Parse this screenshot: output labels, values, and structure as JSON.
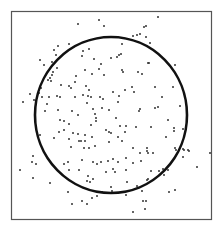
{
  "chart_data": {
    "type": "scatter",
    "title": "",
    "xlabel": "",
    "ylabel": "",
    "grid": false,
    "legend": null,
    "frame": {
      "x0": 11,
      "y0": 11,
      "x1": 211,
      "y1": 219
    },
    "circle": {
      "cx": 111,
      "cy": 115,
      "rx": 76,
      "ry": 78,
      "stroke": "#111111",
      "stroke_width": 2.6
    },
    "point_color": "#333333",
    "point_radius": 1.0,
    "points": [
      [
        78,
        24
      ],
      [
        69,
        44
      ],
      [
        58,
        46
      ],
      [
        54,
        50
      ],
      [
        56,
        55
      ],
      [
        40,
        60
      ],
      [
        52,
        62
      ],
      [
        44,
        65
      ],
      [
        57,
        68
      ],
      [
        53,
        72
      ],
      [
        52,
        75
      ],
      [
        50,
        78
      ],
      [
        48,
        80
      ],
      [
        76,
        76
      ],
      [
        82,
        56
      ],
      [
        99,
        20
      ],
      [
        104,
        26
      ],
      [
        144,
        27
      ],
      [
        140,
        34
      ],
      [
        137,
        35
      ],
      [
        133,
        36
      ],
      [
        146,
        37
      ],
      [
        122,
        44
      ],
      [
        89,
        49
      ],
      [
        83,
        51
      ],
      [
        121,
        54
      ],
      [
        119,
        55
      ],
      [
        117,
        57
      ],
      [
        94,
        59
      ],
      [
        111,
        58
      ],
      [
        101,
        64
      ],
      [
        85,
        70
      ],
      [
        99,
        69
      ],
      [
        122,
        70
      ],
      [
        123,
        72
      ],
      [
        138,
        72
      ],
      [
        142,
        74
      ],
      [
        92,
        74
      ],
      [
        104,
        75
      ],
      [
        148,
        63
      ],
      [
        158,
        17
      ],
      [
        146,
        26
      ],
      [
        150,
        43
      ],
      [
        149,
        63
      ],
      [
        175,
        65
      ],
      [
        51,
        81
      ],
      [
        69,
        86
      ],
      [
        75,
        82
      ],
      [
        71,
        88
      ],
      [
        61,
        85
      ],
      [
        41,
        88
      ],
      [
        39,
        93
      ],
      [
        30,
        94
      ],
      [
        23,
        102
      ],
      [
        34,
        100
      ],
      [
        42,
        97
      ],
      [
        49,
        97
      ],
      [
        57,
        96
      ],
      [
        60,
        97
      ],
      [
        47,
        104
      ],
      [
        75,
        97
      ],
      [
        58,
        110
      ],
      [
        45,
        111
      ],
      [
        72,
        111
      ],
      [
        78,
        115
      ],
      [
        60,
        120
      ],
      [
        64,
        121
      ],
      [
        69,
        124
      ],
      [
        64,
        130
      ],
      [
        59,
        132
      ],
      [
        73,
        133
      ],
      [
        78,
        134
      ],
      [
        40,
        135
      ],
      [
        54,
        138
      ],
      [
        69,
        139
      ],
      [
        71,
        147
      ],
      [
        79,
        141
      ],
      [
        86,
        86
      ],
      [
        89,
        90
      ],
      [
        83,
        95
      ],
      [
        88,
        96
      ],
      [
        91,
        97
      ],
      [
        87,
        103
      ],
      [
        100,
        97
      ],
      [
        103,
        99
      ],
      [
        113,
        92
      ],
      [
        119,
        96
      ],
      [
        125,
        90
      ],
      [
        132,
        87
      ],
      [
        134,
        92
      ],
      [
        118,
        102
      ],
      [
        93,
        109
      ],
      [
        102,
        108
      ],
      [
        109,
        110
      ],
      [
        95,
        114
      ],
      [
        96,
        118
      ],
      [
        96,
        121
      ],
      [
        140,
        109
      ],
      [
        139,
        111
      ],
      [
        116,
        118
      ],
      [
        91,
        125
      ],
      [
        120,
        126
      ],
      [
        126,
        126
      ],
      [
        136,
        127
      ],
      [
        106,
        130
      ],
      [
        109,
        132
      ],
      [
        111,
        133
      ],
      [
        125,
        132
      ],
      [
        85,
        135
      ],
      [
        92,
        137
      ],
      [
        118,
        137
      ],
      [
        122,
        141
      ],
      [
        81,
        141
      ],
      [
        85,
        141
      ],
      [
        109,
        142
      ],
      [
        95,
        146
      ],
      [
        89,
        148
      ],
      [
        84,
        148
      ],
      [
        133,
        148
      ],
      [
        147,
        148
      ],
      [
        155,
        87
      ],
      [
        173,
        87
      ],
      [
        162,
        97
      ],
      [
        158,
        107
      ],
      [
        155,
        108
      ],
      [
        180,
        106
      ],
      [
        187,
        110
      ],
      [
        168,
        120
      ],
      [
        151,
        127
      ],
      [
        174,
        128
      ],
      [
        174,
        131
      ],
      [
        183,
        129
      ],
      [
        166,
        137
      ],
      [
        175,
        148
      ],
      [
        183,
        149
      ],
      [
        188,
        150
      ],
      [
        33,
        156
      ],
      [
        32,
        162
      ],
      [
        36,
        164
      ],
      [
        20,
        170
      ],
      [
        33,
        178
      ],
      [
        50,
        183
      ],
      [
        64,
        164
      ],
      [
        68,
        162
      ],
      [
        69,
        170
      ],
      [
        79,
        170
      ],
      [
        68,
        192
      ],
      [
        72,
        204
      ],
      [
        82,
        160
      ],
      [
        93,
        162
      ],
      [
        97,
        164
      ],
      [
        101,
        162
      ],
      [
        108,
        161
      ],
      [
        113,
        159
      ],
      [
        118,
        162
      ],
      [
        126,
        158
      ],
      [
        133,
        163
      ],
      [
        141,
        161
      ],
      [
        140,
        153
      ],
      [
        147,
        151
      ],
      [
        106,
        172
      ],
      [
        113,
        169
      ],
      [
        115,
        172
      ],
      [
        126,
        170
      ],
      [
        88,
        176
      ],
      [
        87,
        181
      ],
      [
        90,
        182
      ],
      [
        93,
        179
      ],
      [
        127,
        182
      ],
      [
        137,
        186
      ],
      [
        147,
        180
      ],
      [
        111,
        187
      ],
      [
        112,
        191
      ],
      [
        102,
        192
      ],
      [
        116,
        193
      ],
      [
        126,
        195
      ],
      [
        97,
        196
      ],
      [
        92,
        198
      ],
      [
        82,
        201
      ],
      [
        87,
        204
      ],
      [
        143,
        201
      ],
      [
        145,
        209
      ],
      [
        133,
        212
      ],
      [
        142,
        191
      ],
      [
        148,
        153
      ],
      [
        153,
        153
      ],
      [
        176,
        150
      ],
      [
        183,
        157
      ],
      [
        184,
        150
      ],
      [
        189,
        151
      ],
      [
        210,
        153
      ],
      [
        197,
        167
      ],
      [
        151,
        171
      ],
      [
        159,
        171
      ],
      [
        163,
        169
      ],
      [
        168,
        170
      ],
      [
        164,
        175
      ],
      [
        148,
        179
      ],
      [
        169,
        192
      ],
      [
        175,
        190
      ],
      [
        146,
        201
      ]
    ],
    "note": "Coordinates are pixel positions within the 223x235 image; random points scattered in a square frame with an inscribed circle."
  },
  "colors": {
    "background": "#ffffff",
    "frame": "#555555",
    "circle": "#111111",
    "points": "#333333"
  }
}
